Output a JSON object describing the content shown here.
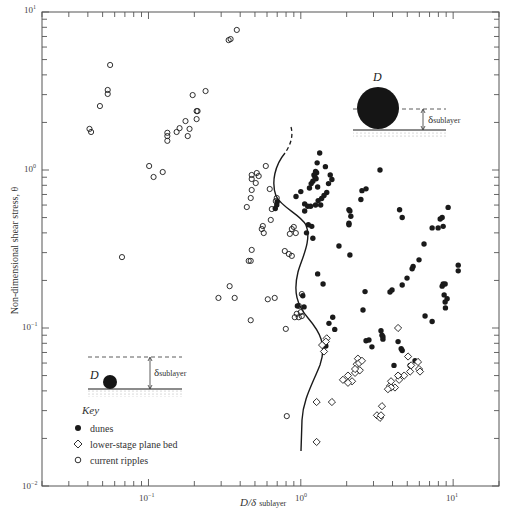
{
  "chart_data": {
    "type": "scatter",
    "title": "",
    "xlabel": "D/δ sublayer",
    "ylabel": "Non-dimensional shear stress, θ",
    "xscale": "log",
    "yscale": "log",
    "xlim": [
      0.02,
      20
    ],
    "ylim": [
      0.01,
      10
    ],
    "x_ticks": [
      "10^-1",
      "10^0",
      "10^1"
    ],
    "y_ticks": [
      "10^-2",
      "10^-1",
      "10^0",
      "10^1"
    ],
    "grid": false,
    "legend_position": "lower left",
    "legend_title": "Key",
    "series": [
      {
        "name": "dunes",
        "marker": "filled-circle",
        "points": [
          [
            1.28,
            1.11
          ],
          [
            1.25,
            0.98
          ],
          [
            1.27,
            0.96
          ],
          [
            1.22,
            0.93
          ],
          [
            1.24,
            0.9
          ],
          [
            1.26,
            0.88
          ],
          [
            1.2,
            0.85
          ],
          [
            1.17,
            0.82
          ],
          [
            1.14,
            0.77
          ],
          [
            1.29,
            0.78
          ],
          [
            1.33,
            1.28
          ],
          [
            1.45,
            1.05
          ],
          [
            1.56,
            0.93
          ],
          [
            1.6,
            0.87
          ],
          [
            1.52,
            0.82
          ],
          [
            1.48,
            0.72
          ],
          [
            1.42,
            0.69
          ],
          [
            1.37,
            0.66
          ],
          [
            1.3,
            0.64
          ],
          [
            1.35,
            0.6
          ],
          [
            1.25,
            0.6
          ],
          [
            1.06,
            0.61
          ],
          [
            1.11,
            0.59
          ],
          [
            1.16,
            0.59
          ],
          [
            1.06,
            0.55
          ],
          [
            1.12,
            0.45
          ],
          [
            1.18,
            0.44
          ],
          [
            1.09,
            0.4
          ],
          [
            1.2,
            0.37
          ],
          [
            1.0,
            0.73
          ],
          [
            0.93,
            0.68
          ],
          [
            0.7,
            0.63
          ],
          [
            0.695,
            0.6
          ],
          [
            0.68,
            0.57
          ],
          [
            1.78,
            0.33
          ],
          [
            1.29,
            0.22
          ],
          [
            1.4,
            0.19
          ],
          [
            1.03,
            0.16
          ],
          [
            0.95,
            0.138
          ],
          [
            1.05,
            0.136
          ],
          [
            2.1,
            0.29
          ],
          [
            2.07,
            0.45
          ],
          [
            2.07,
            0.46
          ],
          [
            2.13,
            0.51
          ],
          [
            2.1,
            0.55
          ],
          [
            2.07,
            0.56
          ],
          [
            2.52,
            0.74
          ],
          [
            2.48,
            0.65
          ],
          [
            2.68,
            0.76
          ],
          [
            1.53,
            0.107
          ],
          [
            1.62,
            0.117
          ],
          [
            1.67,
            0.098
          ],
          [
            1.46,
            0.077
          ],
          [
            1.45,
            0.078
          ],
          [
            3.31,
            1.0
          ],
          [
            2.64,
            0.17
          ],
          [
            2.56,
            0.13
          ],
          [
            3.41,
            0.09
          ],
          [
            3.46,
            0.085
          ],
          [
            2.68,
            0.083
          ],
          [
            2.8,
            0.084
          ],
          [
            2.93,
            0.076
          ],
          [
            3.97,
            0.174
          ],
          [
            3.85,
            0.169
          ],
          [
            3.36,
            0.096
          ],
          [
            3.46,
            0.088
          ],
          [
            4.35,
            0.082
          ],
          [
            4.56,
            0.074
          ],
          [
            4.63,
            0.072
          ],
          [
            4.09,
            0.058
          ],
          [
            4.35,
            0.05
          ],
          [
            5.22,
            0.058
          ],
          [
            5.62,
            0.062
          ],
          [
            7.28,
            0.11
          ],
          [
            6.54,
            0.119
          ],
          [
            8.6,
            0.19
          ],
          [
            8.47,
            0.184
          ],
          [
            8.73,
            0.162
          ],
          [
            8.86,
            0.19
          ],
          [
            9.27,
            0.58
          ],
          [
            8.47,
            0.5
          ],
          [
            8.22,
            0.49
          ],
          [
            8.6,
            0.44
          ],
          [
            7.97,
            0.43
          ],
          [
            7.28,
            0.43
          ],
          [
            6.44,
            0.34
          ],
          [
            5.97,
            0.27
          ],
          [
            5.46,
            0.245
          ],
          [
            5.38,
            0.237
          ],
          [
            4.98,
            0.207
          ],
          [
            4.63,
            0.187
          ],
          [
            10.8,
            0.25
          ],
          [
            10.8,
            0.23
          ],
          [
            9.13,
            0.153
          ],
          [
            8.86,
            0.146
          ],
          [
            8.9,
            0.134
          ],
          [
            4.63,
            0.5
          ],
          [
            4.45,
            0.56
          ]
        ]
      },
      {
        "name": "lower-stage plane bed",
        "marker": "open-diamond",
        "points": [
          [
            1.48,
            0.086
          ],
          [
            1.46,
            0.082
          ],
          [
            1.38,
            0.078
          ],
          [
            1.42,
            0.071
          ],
          [
            1.27,
            0.034
          ],
          [
            1.6,
            0.034
          ],
          [
            1.27,
            0.019
          ],
          [
            1.89,
            0.047
          ],
          [
            2.04,
            0.05
          ],
          [
            2.27,
            0.052
          ],
          [
            2.33,
            0.059
          ],
          [
            2.44,
            0.054
          ],
          [
            2.37,
            0.064
          ],
          [
            2.41,
            0.06
          ],
          [
            2.52,
            0.062
          ],
          [
            2.27,
            0.055
          ],
          [
            2.17,
            0.046
          ],
          [
            2.04,
            0.045
          ],
          [
            3.16,
            0.028
          ],
          [
            3.31,
            0.027
          ],
          [
            3.36,
            0.028
          ],
          [
            3.41,
            0.032
          ],
          [
            3.85,
            0.043
          ],
          [
            4.35,
            0.1
          ],
          [
            5.06,
            0.066
          ],
          [
            5.97,
            0.055
          ],
          [
            5.3,
            0.058
          ],
          [
            5.22,
            0.053
          ],
          [
            4.77,
            0.05
          ],
          [
            4.42,
            0.047
          ],
          [
            4.15,
            0.042
          ],
          [
            3.91,
            0.042
          ],
          [
            3.73,
            0.041
          ],
          [
            6.06,
            0.053
          ],
          [
            5.88,
            0.061
          ],
          [
            4.35,
            0.05
          ],
          [
            3.91,
            0.046
          ]
        ]
      },
      {
        "name": "current ripples",
        "marker": "open-circle",
        "points": [
          [
            0.041,
            1.82
          ],
          [
            0.042,
            1.74
          ],
          [
            0.048,
            2.54
          ],
          [
            0.054,
            3.03
          ],
          [
            0.054,
            3.21
          ],
          [
            0.056,
            4.62
          ],
          [
            0.067,
            0.281
          ],
          [
            0.101,
            1.06
          ],
          [
            0.108,
            0.903
          ],
          [
            0.124,
            0.971
          ],
          [
            0.133,
            1.53
          ],
          [
            0.133,
            1.64
          ],
          [
            0.133,
            1.72
          ],
          [
            0.153,
            1.74
          ],
          [
            0.16,
            1.84
          ],
          [
            0.175,
            2.04
          ],
          [
            0.181,
            1.64
          ],
          [
            0.186,
            1.82
          ],
          [
            0.195,
            2.98
          ],
          [
            0.207,
            2.1
          ],
          [
            0.21,
            2.36
          ],
          [
            0.207,
            2.36
          ],
          [
            0.237,
            3.16
          ],
          [
            0.336,
            6.64
          ],
          [
            0.346,
            6.74
          ],
          [
            0.38,
            7.7
          ],
          [
            0.476,
            0.93
          ],
          [
            0.476,
            0.877
          ],
          [
            0.506,
            0.827
          ],
          [
            0.476,
            0.747
          ],
          [
            0.469,
            0.665
          ],
          [
            0.442,
            0.583
          ],
          [
            0.514,
            0.957
          ],
          [
            0.529,
            0.916
          ],
          [
            0.589,
            1.06
          ],
          [
            0.625,
            0.758
          ],
          [
            0.695,
            0.665
          ],
          [
            0.685,
            0.636
          ],
          [
            0.645,
            0.566
          ],
          [
            0.635,
            0.483
          ],
          [
            0.563,
            0.442
          ],
          [
            0.554,
            0.423
          ],
          [
            0.571,
            0.399
          ],
          [
            0.476,
            0.312
          ],
          [
            0.455,
            0.266
          ],
          [
            0.469,
            0.266
          ],
          [
            0.341,
            0.184
          ],
          [
            0.288,
            0.155
          ],
          [
            0.368,
            0.155
          ],
          [
            0.469,
            0.112
          ],
          [
            0.607,
            0.152
          ],
          [
            0.674,
            0.155
          ],
          [
            0.873,
            0.423
          ],
          [
            0.899,
            0.436
          ],
          [
            0.927,
            0.399
          ],
          [
            0.847,
            0.394
          ],
          [
            0.785,
            0.307
          ],
          [
            0.834,
            0.294
          ],
          [
            0.873,
            0.286
          ],
          [
            1.015,
            0.164
          ],
          [
            0.97,
            0.138
          ],
          [
            1.0,
            0.126
          ],
          [
            0.941,
            0.123
          ],
          [
            0.97,
            0.117
          ],
          [
            0.913,
            0.117
          ],
          [
            1.015,
            0.119
          ],
          [
            0.797,
            0.0987
          ],
          [
            0.809,
            0.0277
          ]
        ]
      }
    ],
    "annotations": {
      "boundary_curve": "solid line with dashed upper segment separating current ripples from dunes / plane bed",
      "inset_small_grain": {
        "label": "D",
        "delta_label": "δ",
        "delta_sub": "sublayer"
      },
      "inset_large_grain": {
        "label": "D",
        "delta_label": "δ",
        "delta_sub": "sublayer"
      }
    }
  },
  "axes": {
    "ylabel": "Non-dimensional shear stress, θ",
    "xlabel_main": "D/δ",
    "xlabel_sub": "sublayer",
    "x_tick_labels": [
      {
        "base": "10",
        "exp": "−1"
      },
      {
        "base": "10",
        "exp": "0"
      },
      {
        "base": "10",
        "exp": "1"
      }
    ],
    "y_tick_labels": [
      {
        "base": "10",
        "exp": "1"
      },
      {
        "base": "10",
        "exp": "0"
      },
      {
        "base": "10",
        "exp": "−1"
      },
      {
        "base": "10",
        "exp": "−2"
      }
    ]
  },
  "legend": {
    "title": "Key",
    "items": [
      {
        "label": "dunes"
      },
      {
        "label": "lower-stage plane bed"
      },
      {
        "label": "current ripples"
      }
    ]
  },
  "insets": {
    "small": {
      "d_label": "D",
      "delta": "δ",
      "delta_sub": "sublayer"
    },
    "large": {
      "d_label": "D",
      "delta": "δ",
      "delta_sub": "sublayer"
    }
  },
  "colors": {
    "ink": "#1a1a1a",
    "axis": "#555555",
    "background": "#ffffff"
  }
}
